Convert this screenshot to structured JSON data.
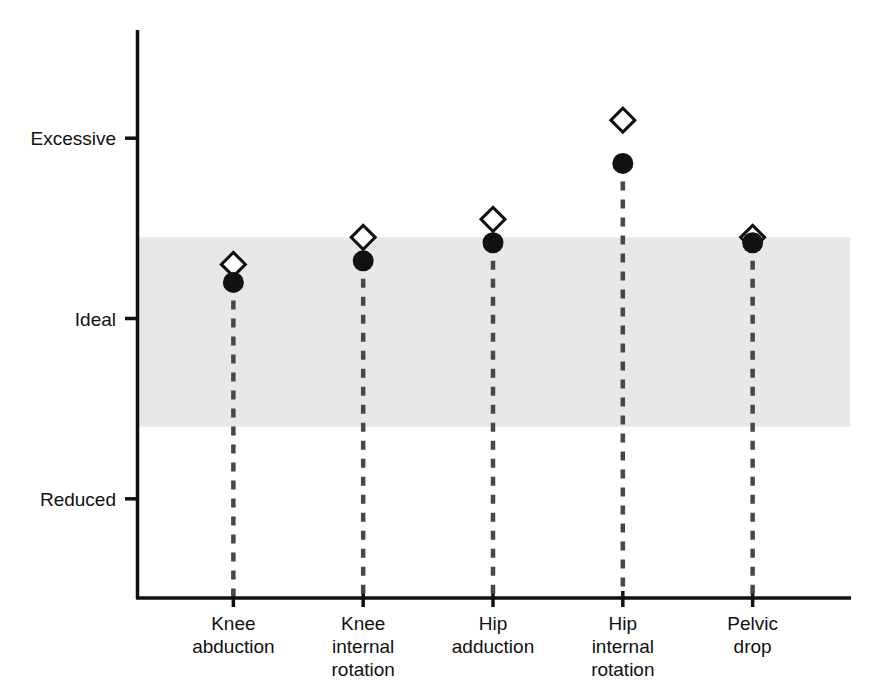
{
  "chart_data": {
    "type": "scatter",
    "title": "",
    "subtitle": "",
    "xlabel": "",
    "ylabel": "",
    "grid": false,
    "legend_position": "none",
    "categories": [
      "Knee abduction",
      "Knee internal rotation",
      "Hip adduction",
      "Hip internal rotation",
      "Pelvic drop"
    ],
    "category_lines": [
      [
        "Knee",
        "abduction"
      ],
      [
        "Knee",
        "internal",
        "rotation"
      ],
      [
        "Hip",
        "adduction"
      ],
      [
        "Hip",
        "internal",
        "rotation"
      ],
      [
        "Pelvic",
        "drop"
      ]
    ],
    "y_axis": {
      "type": "ordinal",
      "tick_labels": [
        "Excessive",
        "Ideal",
        "Reduced"
      ],
      "tick_values": [
        2,
        1,
        0
      ],
      "ylim": [
        -0.55,
        2.6
      ]
    },
    "shaded_band": {
      "label": "Ideal range",
      "y_top": 1.45,
      "y_bottom": 0.4,
      "color": "#e8e8e8"
    },
    "series": [
      {
        "name": "Open marker",
        "marker": "diamond-open",
        "color": "#111111",
        "values": [
          1.3,
          1.45,
          1.55,
          2.1,
          1.45
        ]
      },
      {
        "name": "Filled marker",
        "marker": "circle-filled",
        "color": "#111111",
        "values": [
          1.2,
          1.32,
          1.42,
          1.86,
          1.42
        ]
      }
    ],
    "dropline_style": "dashed",
    "dropline_color": "#474747"
  },
  "colors": {
    "axis": "#111111",
    "band": "#e8e8e8",
    "marker_fill": "#111111",
    "marker_open_fill": "#ffffff",
    "dropline": "#474747",
    "background": "#ffffff"
  }
}
